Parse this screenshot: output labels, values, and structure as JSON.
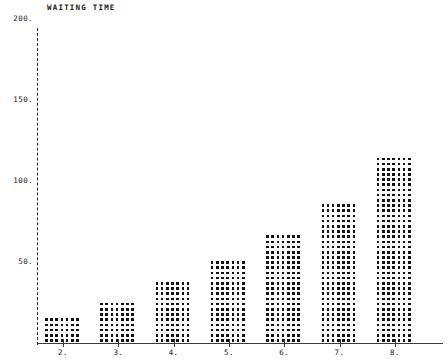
{
  "chart_data": {
    "type": "bar",
    "title": "WAITING TIME",
    "xlabel": "",
    "ylabel": "",
    "categories": [
      "2.",
      "3.",
      "4.",
      "5.",
      "6.",
      "7.",
      "8."
    ],
    "x": [
      2,
      3,
      4,
      5,
      6,
      7,
      8
    ],
    "values": [
      15,
      25,
      40,
      50,
      67,
      86,
      115
    ],
    "ylim": [
      0,
      210
    ],
    "xlim": [
      1.5,
      8.5
    ],
    "yticks": [
      50,
      100,
      150,
      200
    ],
    "ytick_labels": [
      "50.",
      "100.",
      "150.",
      "200."
    ],
    "grid": false,
    "legend": null,
    "style": "dot-matrix-printer",
    "series": [
      {
        "name": "waiting time",
        "values": [
          15,
          25,
          40,
          50,
          67,
          86,
          115
        ]
      }
    ]
  },
  "axes": {
    "y_axis_name": "y-axis",
    "x_axis_name": "x-axis"
  }
}
